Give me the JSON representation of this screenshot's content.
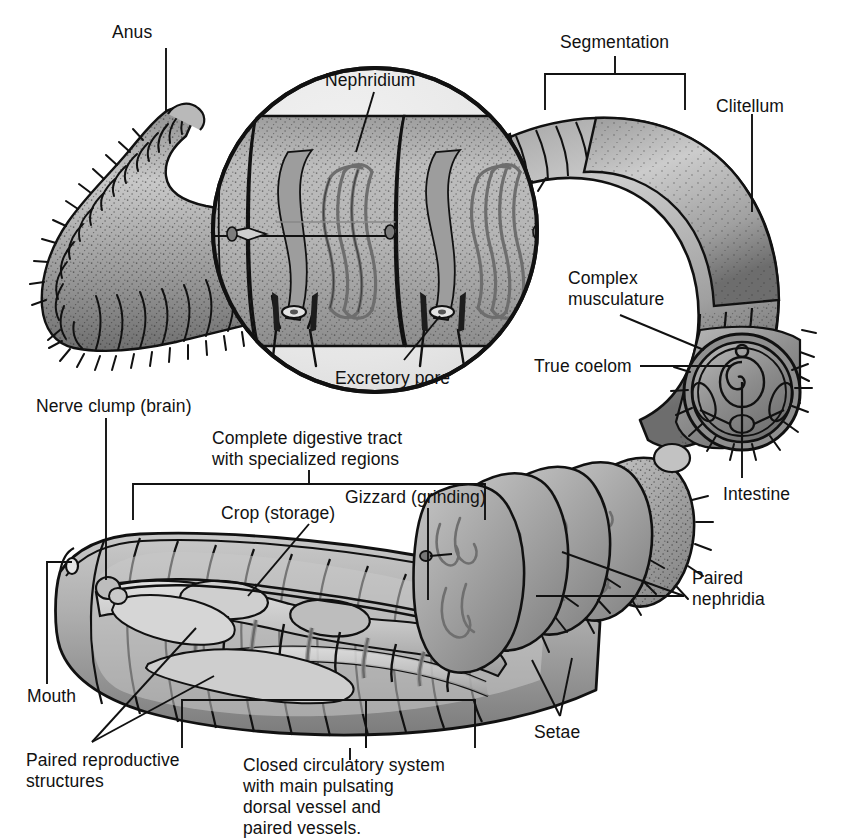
{
  "figure": {
    "background_color": "#ffffff",
    "ink_color": "#111111",
    "palette": {
      "outline": "#111111",
      "body_light": "#d9d9d9",
      "body_mid": "#b2b2b2",
      "body_dark": "#8c8c8c",
      "body_shadow": "#6e6e6e",
      "organ_light": "#cfcfcf",
      "organ_mid": "#a8a8a8",
      "inset_field": "#ececec",
      "stipple": "#2b2b2b"
    }
  },
  "labels": {
    "anus": "Anus",
    "nephridium": "Nephridium",
    "excretory_pore": "Excretory pore",
    "segmentation": "Segmentation",
    "clitellum": "Clitellum",
    "complex_musculature_l1": "Complex",
    "complex_musculature_l2": "musculature",
    "true_coelom": "True coelom",
    "intestine": "Intestine",
    "nerve_clump": "Nerve clump (brain)",
    "digestive_l1": "Complete digestive tract",
    "digestive_l2": "with specialized regions",
    "crop": "Crop (storage)",
    "gizzard": "Gizzard (grinding)",
    "mouth": "Mouth",
    "paired_reproductive_l1": "Paired reproductive",
    "paired_reproductive_l2": "structures",
    "circulatory_l1": "Closed circulatory system",
    "circulatory_l2": "with main pulsating",
    "circulatory_l3": "dorsal vessel and",
    "circulatory_l4": "paired vessels.",
    "paired_nephridia_l1": "Paired",
    "paired_nephridia_l2": "nephridia",
    "setae": "Setae"
  },
  "callouts": [
    {
      "name": "anus",
      "text": "Anus",
      "x": 112,
      "y": 22,
      "leader": "vertical"
    },
    {
      "name": "nephridium",
      "text": "Nephridium",
      "x": 325,
      "y": 70,
      "leader": "diagonal"
    },
    {
      "name": "excretory-pore",
      "text": "Excretory pore",
      "x": 335,
      "y": 368,
      "leader": "diagonal"
    },
    {
      "name": "segmentation",
      "text": "Segmentation",
      "x": 565,
      "y": 34,
      "leader": "bracket"
    },
    {
      "name": "clitellum",
      "text": "Clitellum",
      "x": 718,
      "y": 99,
      "leader": "vertical"
    },
    {
      "name": "complex-musculature",
      "text": "Complex musculature",
      "x": 568,
      "y": 272,
      "leader": "diagonal"
    },
    {
      "name": "true-coelom",
      "text": "True coelom",
      "x": 565,
      "y": 359,
      "leader": "horizontal"
    },
    {
      "name": "intestine",
      "text": "Intestine",
      "x": 723,
      "y": 486,
      "leader": "vertical"
    },
    {
      "name": "nerve-clump",
      "text": "Nerve clump (brain)",
      "x": 36,
      "y": 399,
      "leader": "vertical"
    },
    {
      "name": "complete-digestive-tract",
      "text": "Complete digestive tract with specialized regions",
      "x": 212,
      "y": 432,
      "leader": "bracket"
    },
    {
      "name": "crop",
      "text": "Crop (storage)",
      "x": 221,
      "y": 505,
      "leader": "vertical"
    },
    {
      "name": "gizzard",
      "text": "Gizzard (grinding)",
      "x": 345,
      "y": 489,
      "leader": "vertical"
    },
    {
      "name": "mouth",
      "text": "Mouth",
      "x": 27,
      "y": 690,
      "leader": "elbow"
    },
    {
      "name": "paired-reproductive-structures",
      "text": "Paired reproductive structures",
      "x": 28,
      "y": 752,
      "leader": "double-diagonal"
    },
    {
      "name": "closed-circulatory-system",
      "text": "Closed circulatory system with main pulsating dorsal vessel and paired vessels.",
      "x": 243,
      "y": 757,
      "leader": "bracket"
    },
    {
      "name": "paired-nephridia",
      "text": "Paired nephridia",
      "x": 692,
      "y": 572,
      "leader": "double-diagonal"
    },
    {
      "name": "setae",
      "text": "Setae",
      "x": 534,
      "y": 725,
      "leader": "double-diagonal"
    }
  ],
  "structures": {
    "posterior_worm": "curved tail with ~30 annular segments and setae",
    "anterior_worm": "cut-away body showing digestive tract, crop, gizzard, dorsal vessel and paired vessels",
    "cross_section": "circular transverse section with coelom, intestine and setae",
    "inset_circle": "magnified two segments showing nephridia coils and excretory pores",
    "segment_count_inset": 2,
    "nephridia_per_segment": 2
  }
}
